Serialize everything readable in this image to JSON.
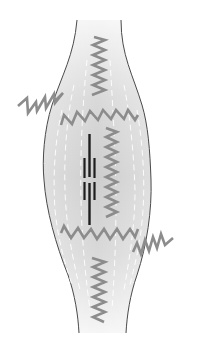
{
  "diagram": {
    "title": "",
    "colors": {
      "background": "#ffffff",
      "body_fill_center": "#cfcfcf",
      "body_fill_edge": "#f4f4f4",
      "outline": "#4a4a4a",
      "spring": "#8c8c8c",
      "filament": "#1e1e1e",
      "fiber_lines": "#ffffff"
    },
    "elements": {
      "body": "spindle-shaped muscle fiber",
      "springs": [
        "top-vertical-spring",
        "left-diagonal-spring",
        "top-horizontal-spring",
        "right-vertical-spring",
        "bottom-horizontal-spring",
        "right-diagonal-spring",
        "bottom-vertical-spring"
      ],
      "filaments": "central thick and thin filaments (sarcomere)"
    }
  }
}
